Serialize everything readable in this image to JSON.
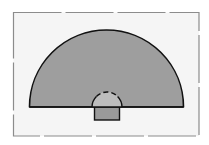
{
  "diagram": {
    "type": "geometric-shapes",
    "background": "#ffffff",
    "frame": {
      "x": 13,
      "y": 12,
      "width": 186,
      "height": 124,
      "fill": "#f5f5f5",
      "stroke": "#8c8c8c",
      "style": "dashed"
    },
    "large_semicircle": {
      "cx": 106.5,
      "cy": 107,
      "r": 77,
      "fill": "#9e9e9e",
      "stroke": "#111111"
    },
    "small_semicircle": {
      "cx": 107,
      "cy": 107,
      "r": 15,
      "fill": "#bdbdbd",
      "stroke": "#111111",
      "style": "dashed-top"
    },
    "rectangle": {
      "x": 94,
      "y": 107,
      "width": 25,
      "height": 13,
      "fill": "#9a9a9a",
      "stroke": "#111111"
    },
    "colors": {
      "dark_gray": "#9e9e9e",
      "light_gray": "#bdbdbd",
      "outline": "#111111"
    }
  }
}
